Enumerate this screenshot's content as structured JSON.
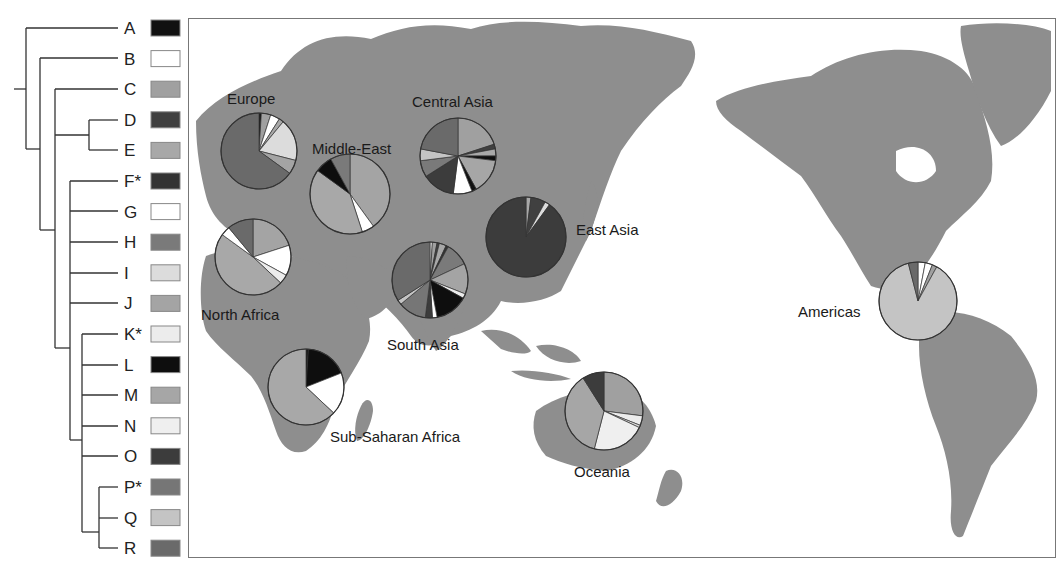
{
  "legend": {
    "haplogroups": [
      {
        "label": "A",
        "color": "#111111"
      },
      {
        "label": "B",
        "color": "#ffffff"
      },
      {
        "label": "C",
        "color": "#a0a0a0"
      },
      {
        "label": "D",
        "color": "#404040"
      },
      {
        "label": "E",
        "color": "#a8a8a8"
      },
      {
        "label": "F*",
        "color": "#333333"
      },
      {
        "label": "G",
        "color": "#ffffff"
      },
      {
        "label": "H",
        "color": "#7a7a7a"
      },
      {
        "label": "I",
        "color": "#dcdcdc"
      },
      {
        "label": "J",
        "color": "#a4a4a4"
      },
      {
        "label": "K*",
        "color": "#ececec"
      },
      {
        "label": "L",
        "color": "#0e0e0e"
      },
      {
        "label": "M",
        "color": "#a6a6a6"
      },
      {
        "label": "N",
        "color": "#efefef"
      },
      {
        "label": "O",
        "color": "#3c3c3c"
      },
      {
        "label": "P*",
        "color": "#767676"
      },
      {
        "label": "Q",
        "color": "#c4c4c4"
      },
      {
        "label": "R",
        "color": "#6a6a6a"
      }
    ]
  },
  "map": {
    "land_color": "#8e8e8e",
    "water_color": "#ffffff"
  },
  "chart_data": {
    "type": "pie",
    "title": "",
    "legend_entries": [
      "A",
      "B",
      "C",
      "D",
      "E",
      "F*",
      "G",
      "H",
      "I",
      "J",
      "K*",
      "L",
      "M",
      "N",
      "O",
      "P*",
      "Q",
      "R"
    ],
    "regions": [
      {
        "name": "Europe",
        "cx": 258,
        "cy": 150,
        "r": 38,
        "slices": [
          {
            "g": "A",
            "v": 1
          },
          {
            "g": "C",
            "v": 4
          },
          {
            "g": "G",
            "v": 4
          },
          {
            "g": "E",
            "v": 2
          },
          {
            "g": "I",
            "v": 18
          },
          {
            "g": "J",
            "v": 6
          },
          {
            "g": "R",
            "v": 65
          }
        ]
      },
      {
        "name": "Middle-East",
        "cx": 349,
        "cy": 193,
        "r": 40,
        "slices": [
          {
            "g": "J",
            "v": 40
          },
          {
            "g": "G",
            "v": 5
          },
          {
            "g": "E",
            "v": 40
          },
          {
            "g": "L",
            "v": 7
          },
          {
            "g": "H",
            "v": 8
          }
        ]
      },
      {
        "name": "Central Asia",
        "cx": 457,
        "cy": 155,
        "r": 38,
        "slices": [
          {
            "g": "C",
            "v": 20
          },
          {
            "g": "D",
            "v": 2
          },
          {
            "g": "E",
            "v": 3
          },
          {
            "g": "L",
            "v": 2
          },
          {
            "g": "M",
            "v": 15
          },
          {
            "g": "A",
            "v": 2
          },
          {
            "g": "G",
            "v": 8
          },
          {
            "g": "O",
            "v": 14
          },
          {
            "g": "H",
            "v": 7
          },
          {
            "g": "Q",
            "v": 5
          },
          {
            "g": "R",
            "v": 22
          }
        ]
      },
      {
        "name": "East Asia",
        "cx": 525,
        "cy": 236,
        "r": 40,
        "slices": [
          {
            "g": "E",
            "v": 2
          },
          {
            "g": "D",
            "v": 6
          },
          {
            "g": "I",
            "v": 2
          },
          {
            "g": "O",
            "v": 90
          }
        ]
      },
      {
        "name": "North Africa",
        "cx": 252,
        "cy": 256,
        "r": 38,
        "slices": [
          {
            "g": "J",
            "v": 20
          },
          {
            "g": "G",
            "v": 13
          },
          {
            "g": "K*",
            "v": 4
          },
          {
            "g": "E",
            "v": 48
          },
          {
            "g": "B",
            "v": 4
          },
          {
            "g": "R",
            "v": 11
          }
        ]
      },
      {
        "name": "South Asia",
        "cx": 429,
        "cy": 279,
        "r": 38,
        "slices": [
          {
            "g": "B",
            "v": 1
          },
          {
            "g": "C",
            "v": 2
          },
          {
            "g": "D",
            "v": 1
          },
          {
            "g": "E",
            "v": 3
          },
          {
            "g": "F*",
            "v": 1
          },
          {
            "g": "H",
            "v": 10
          },
          {
            "g": "J",
            "v": 13
          },
          {
            "g": "K*",
            "v": 2
          },
          {
            "g": "L",
            "v": 14
          },
          {
            "g": "G",
            "v": 2
          },
          {
            "g": "O",
            "v": 3
          },
          {
            "g": "P*",
            "v": 12
          },
          {
            "g": "Q",
            "v": 2
          },
          {
            "g": "R",
            "v": 34
          }
        ]
      },
      {
        "name": "Sub-Saharan Africa",
        "cx": 305,
        "cy": 386,
        "r": 38,
        "slices": [
          {
            "g": "A",
            "v": 1
          },
          {
            "g": "L",
            "v": 18
          },
          {
            "g": "B",
            "v": 18
          },
          {
            "g": "E",
            "v": 63
          }
        ]
      },
      {
        "name": "Oceania",
        "cx": 603,
        "cy": 410,
        "r": 39,
        "slices": [
          {
            "g": "C",
            "v": 27
          },
          {
            "g": "K*",
            "v": 4
          },
          {
            "g": "I",
            "v": 1
          },
          {
            "g": "N",
            "v": 22
          },
          {
            "g": "M",
            "v": 37
          },
          {
            "g": "O",
            "v": 9
          }
        ]
      },
      {
        "name": "Americas",
        "cx": 917,
        "cy": 300,
        "r": 39,
        "slices": [
          {
            "g": "B",
            "v": 3
          },
          {
            "g": "G",
            "v": 3
          },
          {
            "g": "C",
            "v": 2
          },
          {
            "g": "Q",
            "v": 88
          },
          {
            "g": "R",
            "v": 4
          }
        ]
      }
    ]
  },
  "labels": {
    "europe": "Europe",
    "middle_east": "Middle-East",
    "central_asia": "Central Asia",
    "east_asia": "East Asia",
    "north_africa": "North Africa",
    "south_asia": "South Asia",
    "sub_saharan_africa": "Sub-Saharan Africa",
    "oceania": "Oceania",
    "americas": "Americas"
  }
}
